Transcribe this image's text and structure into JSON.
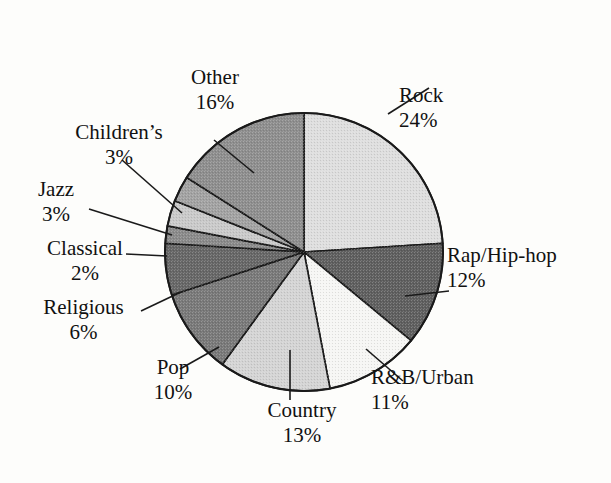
{
  "figure": {
    "kind": "pie-chart",
    "background_color": "#fdfdfb",
    "outline_color": "#1a1a1a",
    "center": {
      "x": 304,
      "y": 252
    },
    "radius": 139
  },
  "chart_data": {
    "type": "pie",
    "title": "",
    "subtitle": "",
    "xlabel": "",
    "ylabel": "",
    "legend_position": "none",
    "grid": false,
    "start_angle_deg": 0,
    "direction": "clockwise",
    "units": "percent",
    "total": 100,
    "categories": [
      "Rock",
      "Rap/Hip-hop",
      "R&B/Urban",
      "Country",
      "Pop",
      "Religious",
      "Classical",
      "Jazz",
      "Children's",
      "Other"
    ],
    "values": [
      24,
      12,
      11,
      13,
      10,
      6,
      2,
      3,
      3,
      16
    ],
    "slices": [
      {
        "label": "Rock",
        "percent": 24,
        "percent_text": "24%",
        "fill": "#dedede",
        "start_deg": 0,
        "end_deg": 86.4
      },
      {
        "label": "Rap/Hip-hop",
        "percent": 12,
        "percent_text": "12%",
        "fill": "#5f5f5f",
        "start_deg": 86.4,
        "end_deg": 129.6
      },
      {
        "label": "R&B/Urban",
        "percent": 11,
        "percent_text": "11%",
        "fill": "#f6f6f4",
        "start_deg": 129.6,
        "end_deg": 169.2
      },
      {
        "label": "Country",
        "percent": 13,
        "percent_text": "13%",
        "fill": "#d4d4d4",
        "start_deg": 169.2,
        "end_deg": 216.0
      },
      {
        "label": "Pop",
        "percent": 10,
        "percent_text": "10%",
        "fill": "#797979",
        "start_deg": 216.0,
        "end_deg": 252.0
      },
      {
        "label": "Religious",
        "percent": 6,
        "percent_text": "6%",
        "fill": "#676767",
        "start_deg": 252.0,
        "end_deg": 273.6
      },
      {
        "label": "Classical",
        "percent": 2,
        "percent_text": "2%",
        "fill": "#8a8a8a",
        "start_deg": 273.6,
        "end_deg": 280.8
      },
      {
        "label": "Jazz",
        "percent": 3,
        "percent_text": "3%",
        "fill": "#c9c9c9",
        "start_deg": 280.8,
        "end_deg": 291.6
      },
      {
        "label": "Children's",
        "percent": 3,
        "percent_text": "3%",
        "fill": "#a2a2a2",
        "start_deg": 291.6,
        "end_deg": 302.4
      },
      {
        "label": "Other",
        "percent": 16,
        "percent_text": "16%",
        "fill": "#8e8e8e",
        "start_deg": 302.4,
        "end_deg": 360.0
      }
    ]
  },
  "labels": {
    "rock": {
      "name": "Rock",
      "percent": "24%"
    },
    "rap": {
      "name": "Rap/Hip-hop",
      "percent": "12%"
    },
    "rnb": {
      "name": "R&B/Urban",
      "percent": "11%"
    },
    "country": {
      "name": "Country",
      "percent": "13%"
    },
    "pop": {
      "name": "Pop",
      "percent": "10%"
    },
    "religious": {
      "name": "Religious",
      "percent": "6%"
    },
    "classical": {
      "name": "Classical",
      "percent": "2%"
    },
    "jazz": {
      "name": "Jazz",
      "percent": "3%"
    },
    "children": {
      "name": "Children’s",
      "percent": "3%"
    },
    "other": {
      "name": "Other",
      "percent": "16%"
    }
  }
}
